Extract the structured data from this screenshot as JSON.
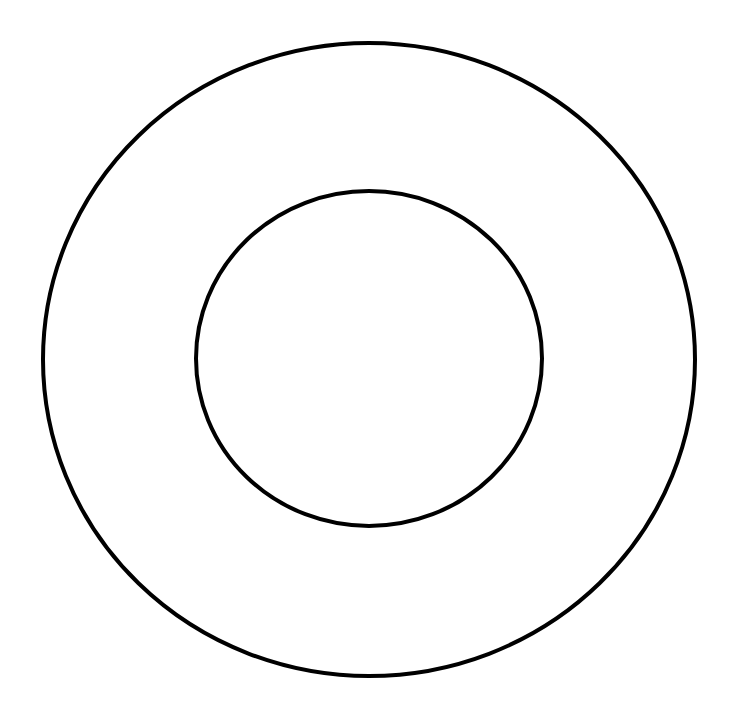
{
  "canvas": {
    "width": 735,
    "height": 708,
    "background": "#ffffff"
  },
  "shapes": {
    "outer_circle": {
      "cx": 369,
      "cy": 359.5,
      "rx": 326,
      "ry": 316.5,
      "stroke": "#000000",
      "stroke_width": 4,
      "fill": "none"
    },
    "inner_circle": {
      "cx": 369,
      "cy": 358.5,
      "rx": 173,
      "ry": 167.5,
      "stroke": "#000000",
      "stroke_width": 4,
      "fill": "none"
    }
  }
}
